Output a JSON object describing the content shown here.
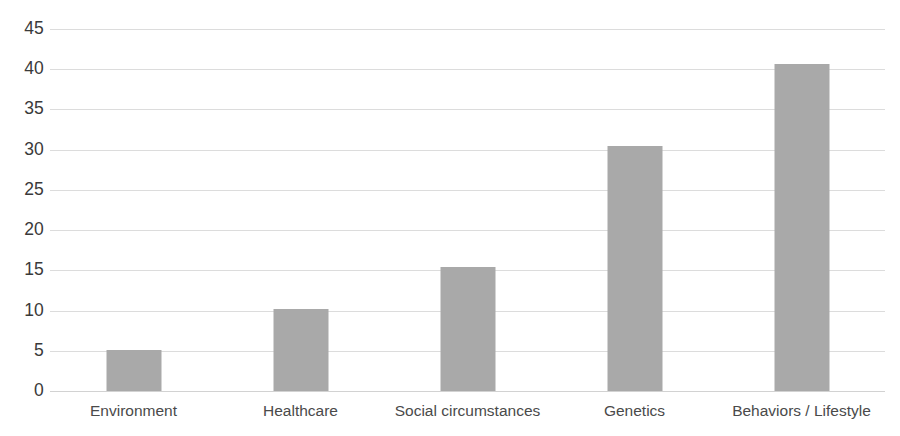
{
  "chart_data": {
    "type": "bar",
    "title": "",
    "subtitle": "",
    "xlabel": "",
    "ylabel": "",
    "categories": [
      "Environment",
      "Healthcare",
      "Social circumstances",
      "Genetics",
      "Behaviors / Lifestyle"
    ],
    "values": [
      5.1,
      10.2,
      15.4,
      30.5,
      40.6
    ],
    "ylim": [
      0,
      45
    ],
    "y_ticks": [
      0,
      5,
      10,
      15,
      20,
      25,
      30,
      35,
      40,
      45
    ],
    "y_tick_labels": [
      "0",
      "5",
      "10",
      "15",
      "20",
      "25",
      "30",
      "35",
      "40",
      "45"
    ],
    "grid": true,
    "legend": false,
    "legend_position": "none",
    "bar_color": "#a9a9a9",
    "gridline_color": "#dcdcdc",
    "axis_text_color": "#3a3a3a",
    "background_color": "#ffffff"
  }
}
